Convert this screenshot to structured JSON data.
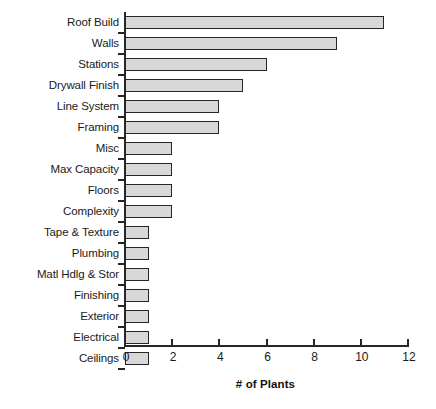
{
  "chart": {
    "background_color": "#ffffff",
    "bar_fill_color": "#d8d8d8",
    "bar_border_color": "#262626",
    "axis_color": "#262626"
  },
  "chart_data": {
    "type": "bar",
    "orientation": "horizontal",
    "title": "",
    "subtitle": "",
    "xlabel": "# of Plants",
    "ylabel": "",
    "xlim": [
      0,
      12
    ],
    "xticks": [
      0,
      2,
      4,
      6,
      8,
      10,
      12
    ],
    "xtick_labels": [
      "0",
      "2",
      "4",
      "6",
      "8",
      "10",
      "12"
    ],
    "grid": false,
    "legend": false,
    "legend_position": "none",
    "categories": [
      "Roof Build",
      "Walls",
      "Stations",
      "Drywall Finish",
      "Line System",
      "Framing",
      "Misc",
      "Max Capacity",
      "Floors",
      "Complexity",
      "Tape & Texture",
      "Plumbing",
      "Matl Hdlg & Stor",
      "Finishing",
      "Exterior",
      "Electrical",
      "Ceilings"
    ],
    "values": [
      11,
      9,
      6,
      5,
      4,
      4,
      2,
      2,
      2,
      2,
      1,
      1,
      1,
      1,
      1,
      1,
      1
    ]
  }
}
